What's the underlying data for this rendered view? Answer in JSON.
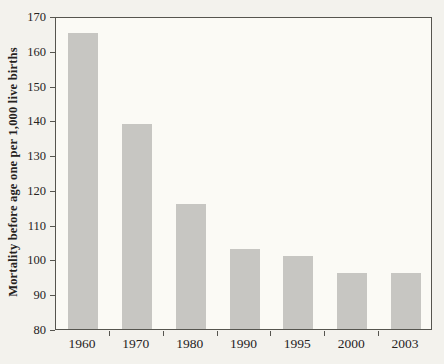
{
  "page": {
    "background": "#f3f2ed"
  },
  "chart_data": {
    "type": "bar",
    "categories": [
      "1960",
      "1970",
      "1980",
      "1990",
      "1995",
      "2000",
      "2003"
    ],
    "values": [
      165,
      139,
      116,
      103,
      101,
      96,
      96
    ],
    "title": "",
    "xlabel": "",
    "ylabel": "Mortality before age one per 1,000 live births",
    "ylim": [
      80,
      170
    ],
    "ytick_step": 10,
    "yticks": [
      80,
      90,
      100,
      110,
      120,
      130,
      140,
      150,
      160,
      170
    ],
    "grid": false,
    "legend": "none",
    "colors": {
      "bar_fill": "#c7c6c2",
      "axis_line": "#56554f",
      "text": "#26231e",
      "plot_background": "#fbfaf5"
    }
  }
}
